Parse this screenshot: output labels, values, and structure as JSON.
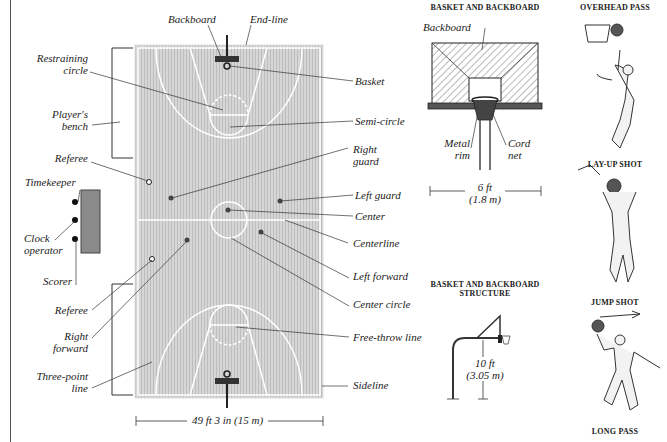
{
  "court": {
    "labels": {
      "backboard": "Backboard",
      "end_line": "End-line",
      "restraining_circle": "Restraining circle",
      "restraining_l1": "Restraining",
      "restraining_l2": "circle",
      "basket": "Basket",
      "players_bench_l1": "Player's",
      "players_bench_l2": "bench",
      "semi_circle": "Semi-circle",
      "right_guard_l1": "Right",
      "right_guard_l2": "guard",
      "referee_top": "Referee",
      "left_guard": "Left guard",
      "timekeeper": "Timekeeper",
      "center": "Center",
      "clock_l1": "Clock",
      "clock_l2": "operator",
      "centerline": "Centerline",
      "scorer": "Scorer",
      "left_forward": "Left forward",
      "referee_bottom": "Referee",
      "center_circle": "Center circle",
      "right_forward_l1": "Right",
      "right_forward_l2": "forward",
      "free_throw_line": "Free-throw line",
      "three_point_l1": "Three-point",
      "three_point_l2": "line",
      "sideline": "Sideline"
    },
    "width_dimension": "49 ft 3 in (15 m)",
    "colors": {
      "floor": "#d2d2d2",
      "lines": "#ffffff",
      "table": "#8a8a8a"
    }
  },
  "basket_backboard": {
    "title": "BASKET AND BACKBOARD",
    "backboard": "Backboard",
    "metal_rim_l1": "Metal",
    "metal_rim_l2": "rim",
    "cord_net_l1": "Cord",
    "cord_net_l2": "net",
    "width_ft": "6 ft",
    "width_m": "(1.8 m)"
  },
  "structure": {
    "title_l1": "BASKET AND BACKBOARD",
    "title_l2": "STRUCTURE",
    "height_ft": "10 ft",
    "height_m": "(3.05 m)"
  },
  "moves": [
    {
      "label": "OVERHEAD PASS"
    },
    {
      "label": "LAY-UP SHOT"
    },
    {
      "label": "JUMP SHOT"
    },
    {
      "label": "LONG PASS"
    }
  ]
}
